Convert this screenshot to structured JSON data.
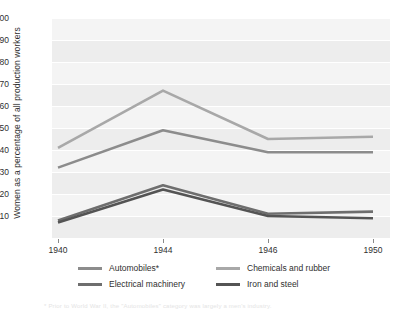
{
  "chart_data": {
    "type": "line",
    "title": "",
    "xlabel": "",
    "ylabel": "Women as a percentage of all production workers",
    "x": [
      1940,
      1944,
      1946,
      1950
    ],
    "xtick_labels": [
      "1940",
      "1944",
      "1946",
      "1950"
    ],
    "ylim": [
      0,
      100
    ],
    "ytick_labels": [
      "100",
      "90",
      "80",
      "70",
      "60",
      "50",
      "40",
      "30",
      "20",
      "10"
    ],
    "yticks": [
      100,
      90,
      80,
      70,
      60,
      50,
      40,
      30,
      20,
      10
    ],
    "grid": true,
    "legend_position": "bottom",
    "series": [
      {
        "name": "Chemicals and rubber",
        "color": "#a8a8a8",
        "values": [
          41,
          67,
          45,
          46
        ]
      },
      {
        "name": "Automobiles*",
        "color": "#8c8c8c",
        "values": [
          32,
          49,
          39,
          39
        ]
      },
      {
        "name": "Electrical machinery",
        "color": "#6e6e6e",
        "values": [
          8,
          24,
          11,
          12
        ]
      },
      {
        "name": "Iron and steel",
        "color": "#545454",
        "values": [
          7,
          22,
          10,
          9
        ]
      }
    ]
  },
  "legend": {
    "entries": [
      {
        "label": "Automobiles*",
        "color": "#8c8c8c"
      },
      {
        "label": "Chemicals and rubber",
        "color": "#a8a8a8"
      },
      {
        "label": "Electrical machinery",
        "color": "#6e6e6e"
      },
      {
        "label": "Iron and steel",
        "color": "#545454"
      }
    ]
  },
  "footnote": {
    "text": "* Prior to World War II, the \"Automobiles\" category was largely a men's industry."
  },
  "colors": {
    "plot_background": "#ededed",
    "band": "#f4f4f4",
    "gridline": "#ffffff",
    "text": "#2f2f2f"
  }
}
